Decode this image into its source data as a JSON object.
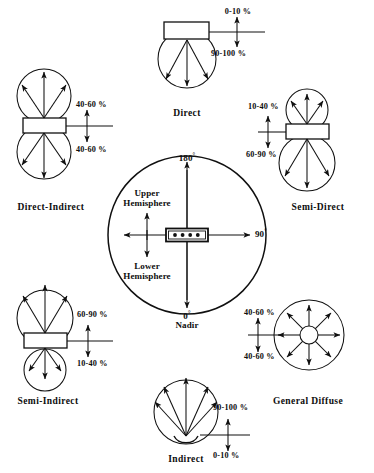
{
  "figure": {
    "stroke_color": "#101010",
    "background": "#ffffff"
  },
  "polar_reference": {
    "top_angle": "180",
    "top_degree_symbol": "°",
    "right_angle": "90",
    "right_degree_symbol": "°",
    "bottom_angle": "0",
    "bottom_degree_symbol": "°",
    "bottom_name": "Nadir",
    "upper_region": "Upper\nHemisphere",
    "upper_region_line1": "Upper",
    "upper_region_line2": "Hemisphere",
    "lower_region_line1": "Lower",
    "lower_region_line2": "Hemisphere",
    "lamp_dot_count": 4
  },
  "distributions": [
    {
      "id": "direct",
      "name": "Direct",
      "up_percent": "0-10 %",
      "down_percent": "90-100 %",
      "luminaire": "rectangle-top",
      "beam": "downward-fan"
    },
    {
      "id": "direct-indirect",
      "name": "Direct-Indirect",
      "up_percent": "40-60 %",
      "down_percent": "40-60 %",
      "luminaire": "rectangle-middle",
      "beam": "two-equal-lobes"
    },
    {
      "id": "semi-direct",
      "name": "Semi-Direct",
      "up_percent": "10-40 %",
      "down_percent": "60-90 %",
      "luminaire": "rectangle-middle",
      "beam": "small-up-large-down"
    },
    {
      "id": "semi-indirect",
      "name": "Semi-Indirect",
      "up_percent": "60-90 %",
      "down_percent": "10-40 %",
      "luminaire": "rectangle-middle",
      "beam": "large-up-small-down"
    },
    {
      "id": "general-diffuse",
      "name": "General Diffuse",
      "up_percent": "40-60 %",
      "down_percent": "40-60 %",
      "luminaire": "small-circle-center",
      "beam": "eight-way-radial"
    },
    {
      "id": "indirect",
      "name": "Indirect",
      "up_percent": "90-100 %",
      "down_percent": "0-10 %",
      "luminaire": "bowl-bottom",
      "beam": "upward-fan"
    }
  ]
}
